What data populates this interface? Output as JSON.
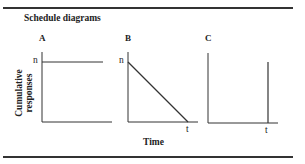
{
  "title": "Schedule diagrams",
  "axes": {
    "ylabel": "Cumulative responses",
    "xlabel": "Time"
  },
  "panels": [
    {
      "label": "A",
      "y_tick": "n",
      "x_tick": "",
      "shape": "horizontal line at n"
    },
    {
      "label": "B",
      "y_tick": "n",
      "x_tick": "t",
      "shape": "line decreasing from n to 0 at t"
    },
    {
      "label": "C",
      "y_tick": "",
      "x_tick": "t",
      "shape": "vertical jump at t"
    }
  ],
  "colors": {
    "line": "#333333",
    "background": "#ffffff"
  }
}
